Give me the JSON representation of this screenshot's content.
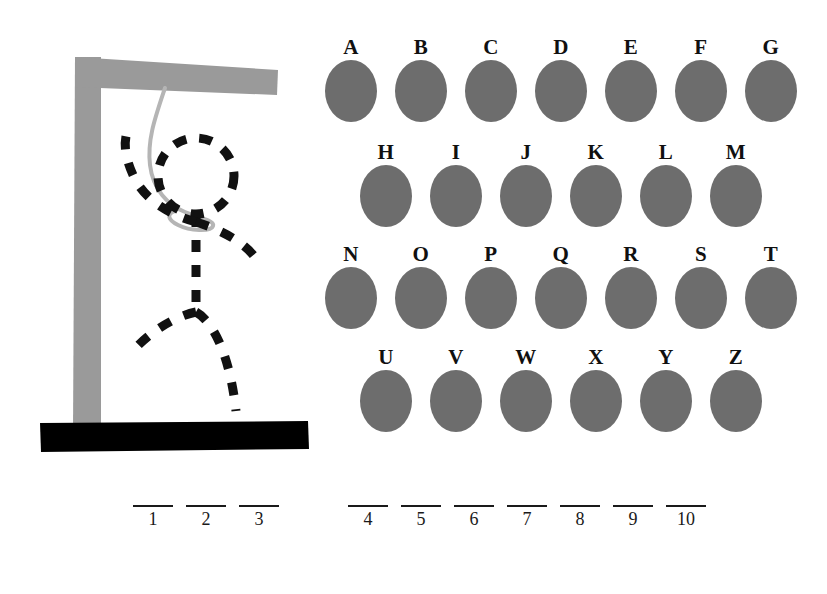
{
  "game": {
    "title": "Hangman",
    "colors": {
      "gallows_post": "#9a9a9a",
      "gallows_base": "#000000",
      "rope": "#b5b5b5",
      "figure_stroke": "#111111",
      "letter_disc": "#6d6d6d",
      "letter_text": "#101010",
      "blank_line": "#1a1a1a",
      "background": "#ffffff"
    },
    "gallows": {
      "post_name": "gallows-post",
      "beam_name": "gallows-crossbeam",
      "base_name": "gallows-base",
      "rope_name": "hanging-rope"
    },
    "figure": {
      "state": "complete",
      "parts": [
        "head",
        "neck",
        "torso",
        "left-arm",
        "right-arm",
        "left-leg",
        "right-leg"
      ],
      "stroke_style": "dashed"
    },
    "keyboard": {
      "rows": [
        {
          "offset": 0,
          "letters": [
            "A",
            "B",
            "C",
            "D",
            "E",
            "F",
            "G"
          ]
        },
        {
          "offset": 1,
          "letters": [
            "H",
            "I",
            "J",
            "K",
            "L",
            "M"
          ]
        },
        {
          "offset": 0,
          "letters": [
            "N",
            "O",
            "P",
            "Q",
            "R",
            "S",
            "T"
          ]
        },
        {
          "offset": 1,
          "letters": [
            "U",
            "V",
            "W",
            "X",
            "Y",
            "Z"
          ]
        }
      ]
    },
    "answer": {
      "words": [
        {
          "slots": [
            {
              "index": "1",
              "letter": ""
            },
            {
              "index": "2",
              "letter": ""
            },
            {
              "index": "3",
              "letter": ""
            }
          ]
        },
        {
          "slots": [
            {
              "index": "4",
              "letter": ""
            },
            {
              "index": "5",
              "letter": ""
            },
            {
              "index": "6",
              "letter": ""
            },
            {
              "index": "7",
              "letter": ""
            },
            {
              "index": "8",
              "letter": ""
            },
            {
              "index": "9",
              "letter": ""
            },
            {
              "index": "10",
              "letter": ""
            }
          ]
        }
      ],
      "total_slots": "10"
    }
  }
}
